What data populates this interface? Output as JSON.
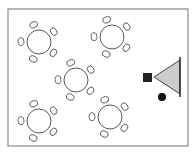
{
  "diagram": {
    "type": "room-layout",
    "colors": {
      "border": "#8a8a8a",
      "stroke": "#444444",
      "screen_fill": "#cccccc",
      "lectern_fill": "#222222",
      "background": "#ffffff"
    },
    "room": {
      "x": 8,
      "y": 9,
      "width": 180,
      "height": 137
    },
    "tables": [
      {
        "id": "table-1",
        "cx": 39,
        "cy": 42,
        "r": 12
      },
      {
        "id": "table-2",
        "cx": 112,
        "cy": 37,
        "r": 12
      },
      {
        "id": "table-3",
        "cx": 76,
        "cy": 80,
        "r": 12
      },
      {
        "id": "table-4",
        "cx": 39,
        "cy": 121,
        "r": 12
      },
      {
        "id": "table-5",
        "cx": 110,
        "cy": 117,
        "r": 12
      }
    ],
    "chairs_per_table": 5,
    "presenter": {
      "lectern": {
        "x": 143,
        "y": 73,
        "size": 9
      },
      "screen": {
        "apex_x": 154,
        "apex_y": 77,
        "base_x": 180,
        "top_y": 57,
        "bottom_y": 97
      },
      "speaker_dot": {
        "cx": 162,
        "cy": 97,
        "r": 4
      }
    }
  }
}
